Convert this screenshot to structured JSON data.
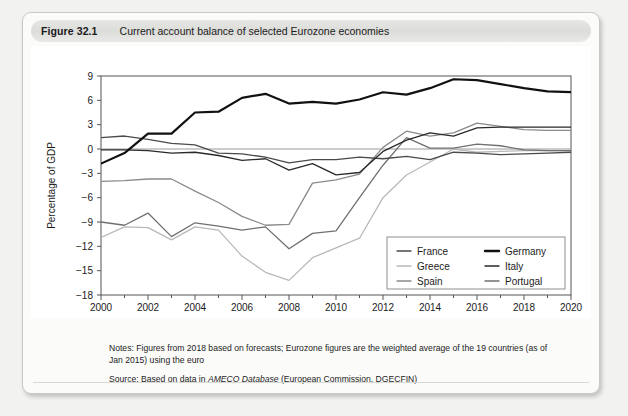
{
  "figure": {
    "number_label": "Figure 32.1",
    "title": "Current account balance of selected Eurozone economies"
  },
  "notes": {
    "notes_text": "Notes: Figures from 2018 based on forecasts; Eurozone figures are the weighted average of the 19 countries (as of Jan 2015) using the euro",
    "source_prefix": "Source: Based on data in ",
    "source_italic": "AMECO Database",
    "source_suffix": " (European Commission, DGECFIN)"
  },
  "chart_data": {
    "type": "line",
    "title": "Current account balance of selected Eurozone economies",
    "xlabel": "",
    "ylabel": "Percentage of GDP",
    "xlim": [
      2000,
      2020
    ],
    "ylim": [
      -18,
      9
    ],
    "ytick_step": 3,
    "yticks": [
      "9",
      "6",
      "3",
      "0",
      "-3",
      "-6",
      "-9",
      "-12",
      "-15",
      "-18"
    ],
    "xticks": [
      "2000",
      "2002",
      "2004",
      "2006",
      "2008",
      "2010",
      "2012",
      "2014",
      "2016",
      "2018",
      "2020"
    ],
    "x": [
      2000,
      2001,
      2002,
      2003,
      2004,
      2005,
      2006,
      2007,
      2008,
      2009,
      2010,
      2011,
      2012,
      2013,
      2014,
      2015,
      2016,
      2017,
      2018,
      2019,
      2020
    ],
    "grid": false,
    "zero_line": true,
    "legend_position": "bottom-right",
    "series": [
      {
        "name": "France",
        "color": "#4a4a4a",
        "width": 1.3,
        "values": [
          1.4,
          1.6,
          1.2,
          0.7,
          0.5,
          -0.5,
          -0.6,
          -1.0,
          -1.7,
          -1.3,
          -1.3,
          -1.0,
          -1.2,
          -0.9,
          -1.3,
          -0.4,
          -0.5,
          -0.7,
          -0.6,
          -0.5,
          -0.4
        ]
      },
      {
        "name": "Germany",
        "color": "#111111",
        "width": 2.2,
        "values": [
          -1.8,
          -0.5,
          1.9,
          1.9,
          4.5,
          4.6,
          6.3,
          6.8,
          5.6,
          5.8,
          5.6,
          6.1,
          7.0,
          6.7,
          7.5,
          8.6,
          8.5,
          8.0,
          7.5,
          7.1,
          7.0
        ]
      },
      {
        "name": "Greece",
        "color": "#b9b9b9",
        "width": 1.3,
        "values": [
          -10.9,
          -9.6,
          -9.7,
          -11.2,
          -9.6,
          -10.0,
          -13.2,
          -15.2,
          -16.2,
          -13.4,
          -12.2,
          -11.0,
          -6.0,
          -3.2,
          -1.6,
          0.0,
          -0.4,
          -0.3,
          -0.2,
          -0.2,
          -0.2
        ]
      },
      {
        "name": "Italy",
        "color": "#2a2a2a",
        "width": 1.3,
        "values": [
          -0.1,
          -0.1,
          -0.2,
          -0.5,
          -0.4,
          -0.8,
          -1.4,
          -1.2,
          -2.6,
          -1.8,
          -3.2,
          -2.9,
          -0.3,
          1.1,
          2.0,
          1.6,
          2.6,
          2.7,
          2.7,
          2.7,
          2.7
        ]
      },
      {
        "name": "Spain",
        "color": "#8a8a8a",
        "width": 1.3,
        "values": [
          -4.0,
          -3.9,
          -3.7,
          -3.7,
          -5.2,
          -6.6,
          -8.3,
          -9.4,
          -9.3,
          -4.2,
          -3.8,
          -3.1,
          0.2,
          2.2,
          1.6,
          2.0,
          3.2,
          2.8,
          2.4,
          2.3,
          2.3
        ]
      },
      {
        "name": "Portugal",
        "color": "#707070",
        "width": 1.3,
        "values": [
          -9.0,
          -9.4,
          -7.9,
          -10.8,
          -9.1,
          -9.5,
          -10.0,
          -9.6,
          -12.3,
          -10.4,
          -10.1,
          -6.0,
          -2.0,
          1.4,
          0.1,
          0.1,
          0.6,
          0.4,
          -0.1,
          -0.2,
          -0.2
        ]
      }
    ],
    "legend": [
      {
        "name": "France",
        "color": "#4a4a4a",
        "width": 1.3
      },
      {
        "name": "Germany",
        "color": "#111111",
        "width": 2.4
      },
      {
        "name": "Greece",
        "color": "#b9b9b9",
        "width": 1.3
      },
      {
        "name": "Italy",
        "color": "#2a2a2a",
        "width": 1.3
      },
      {
        "name": "Spain",
        "color": "#8a8a8a",
        "width": 1.3
      },
      {
        "name": "Portugal",
        "color": "#707070",
        "width": 1.3
      }
    ]
  }
}
